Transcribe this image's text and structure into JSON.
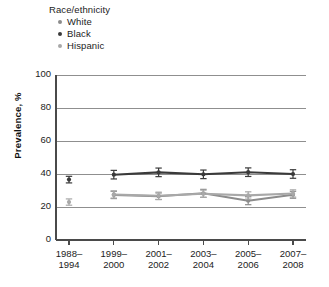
{
  "legend": {
    "title": "Race/ethnicity",
    "items": [
      {
        "label": "White",
        "color": "#8c8c8c"
      },
      {
        "label": "Black",
        "color": "#3a3a3a"
      },
      {
        "label": "Hispanic",
        "color": "#a8a8a8"
      }
    ]
  },
  "chart_data": {
    "type": "line",
    "title": "",
    "xlabel": "",
    "ylabel": "Prevalence, %",
    "ylim": [
      0,
      100
    ],
    "yticks": [
      0,
      20,
      40,
      60,
      80,
      100
    ],
    "ytick_labels": [
      "0",
      "20",
      "40",
      "60",
      "80",
      "100"
    ],
    "categories": [
      "1988–\n1994",
      "1999–\n2000",
      "2001–\n2002",
      "2003–\n2004",
      "2005–\n2006",
      "2007–\n2008"
    ],
    "category_lines": [
      [
        "1988–",
        "1994"
      ],
      [
        "1999–",
        "2000"
      ],
      [
        "2001–",
        "2002"
      ],
      [
        "2003–",
        "2004"
      ],
      [
        "2005–",
        "2006"
      ],
      [
        "2007–",
        "2008"
      ]
    ],
    "grid": true,
    "grid_axis": "y",
    "legend_position": "above-plot-left",
    "error_bars": "95% CI",
    "series": [
      {
        "name": "White",
        "color": "#8c8c8c",
        "values": [
          null,
          27.3,
          26.5,
          28.3,
          23.8,
          27.4
        ],
        "err_low": [
          null,
          2.2,
          2.0,
          2.4,
          2.4,
          2.1
        ],
        "err_high": [
          null,
          2.2,
          2.0,
          2.4,
          2.4,
          2.1
        ]
      },
      {
        "name": "Black",
        "color": "#3a3a3a",
        "values": [
          36.6,
          39.6,
          41.0,
          39.8,
          41.1,
          40.0
        ],
        "err_low": [
          2.0,
          2.6,
          2.6,
          2.6,
          2.6,
          2.6
        ],
        "err_high": [
          2.0,
          2.6,
          2.6,
          2.6,
          2.6,
          2.6
        ]
      },
      {
        "name": "Hispanic",
        "color": "#a8a8a8",
        "values": [
          23.0,
          27.6,
          26.8,
          28.0,
          27.0,
          28.2
        ],
        "err_low": [
          1.9,
          2.2,
          2.2,
          2.2,
          2.2,
          2.2
        ],
        "err_high": [
          1.9,
          2.2,
          2.2,
          2.2,
          2.2,
          2.2
        ]
      }
    ],
    "connected_from_index": 1
  }
}
